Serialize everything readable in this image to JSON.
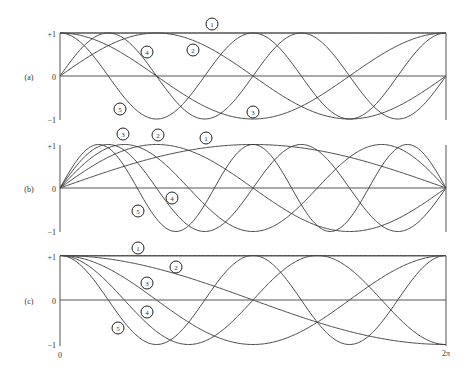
{
  "chart_data": [
    {
      "type": "line",
      "panel_label": "(a)",
      "title": "",
      "xlabel": "",
      "ylabel": "",
      "xlim": [
        0,
        6.2832
      ],
      "ylim": [
        -1,
        1
      ],
      "yticks": [
        "+1",
        "0",
        "−1"
      ],
      "grid": false,
      "series": [
        {
          "name": "1",
          "expr": "1"
        },
        {
          "name": "2",
          "expr": "sin(x)"
        },
        {
          "name": "3",
          "expr": "cos(x)"
        },
        {
          "name": "4",
          "expr": "sin(2x)"
        },
        {
          "name": "5",
          "expr": "cos(2x)"
        }
      ]
    },
    {
      "type": "line",
      "panel_label": "(b)",
      "title": "",
      "xlabel": "",
      "ylabel": "",
      "xlim": [
        0,
        6.2832
      ],
      "ylim": [
        -1,
        1
      ],
      "yticks": [
        "+1",
        "0",
        "−1"
      ],
      "grid": false,
      "series": [
        {
          "name": "1",
          "expr": "sin(x/2)"
        },
        {
          "name": "2",
          "expr": "sin(x)"
        },
        {
          "name": "3",
          "expr": "sin(3x/2)"
        },
        {
          "name": "4",
          "expr": "sin(2x)"
        },
        {
          "name": "5",
          "expr": "sin(5x/2)"
        }
      ]
    },
    {
      "type": "line",
      "panel_label": "(c)",
      "title": "",
      "xlabel": "",
      "ylabel": "",
      "xlim": [
        0,
        6.2832
      ],
      "ylim": [
        -1,
        1
      ],
      "yticks": [
        "+1",
        "0",
        "−1"
      ],
      "xticks": [
        "0",
        "2π"
      ],
      "grid": false,
      "series": [
        {
          "name": "1",
          "expr": "1"
        },
        {
          "name": "2",
          "expr": "cos(x/2)"
        },
        {
          "name": "3",
          "expr": "cos(x)"
        },
        {
          "name": "4",
          "expr": "cos(3x/2)"
        },
        {
          "name": "5",
          "expr": "cos(2x)"
        }
      ]
    }
  ],
  "panels": [
    {
      "label": "(a)",
      "ytick_top": "+1",
      "ytick_mid": "0",
      "ytick_bot": "−1",
      "markers": [
        {
          "text": "1",
          "x": 212,
          "y": 24
        },
        {
          "text": "2",
          "x": 193,
          "y": 50
        },
        {
          "text": "3",
          "x": 253,
          "y": 112
        },
        {
          "text": "4",
          "x": 147,
          "y": 52
        },
        {
          "text": "5",
          "x": 120,
          "y": 109
        }
      ]
    },
    {
      "label": "(b)",
      "ytick_top": "+1",
      "ytick_mid": "0",
      "ytick_bot": "−1",
      "markers": [
        {
          "text": "1",
          "x": 206,
          "y": 138
        },
        {
          "text": "2",
          "x": 158,
          "y": 135
        },
        {
          "text": "3",
          "x": 123,
          "y": 134
        },
        {
          "text": "4",
          "x": 172,
          "y": 198
        },
        {
          "text": "5",
          "x": 138,
          "y": 211
        }
      ]
    },
    {
      "label": "(c)",
      "ytick_top": "+1",
      "ytick_mid": "0",
      "ytick_bot": "−1",
      "markers": [
        {
          "text": "1",
          "x": 138,
          "y": 248
        },
        {
          "text": "2",
          "x": 176,
          "y": 267
        },
        {
          "text": "3",
          "x": 147,
          "y": 283
        },
        {
          "text": "4",
          "x": 147,
          "y": 312
        },
        {
          "text": "5",
          "x": 118,
          "y": 328
        }
      ]
    }
  ],
  "xaxis": {
    "start_label": "0",
    "end_label": "2π"
  },
  "colors": {
    "line": "#333333",
    "axis": "#555555",
    "background": "#ffffff"
  }
}
